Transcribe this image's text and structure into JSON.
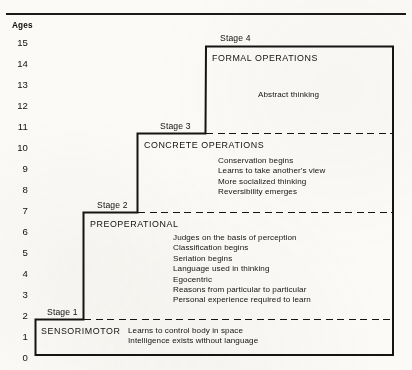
{
  "figure": {
    "running_head": "The Developing Person Through the Life Span",
    "axis_title": "Ages",
    "age_ticks": [
      "15",
      "14",
      "13",
      "12",
      "11",
      "10",
      "9",
      "8",
      "7",
      "6",
      "5",
      "4",
      "3",
      "2",
      "1",
      "0"
    ]
  },
  "stages": [
    {
      "tag": "Stage 1",
      "heading": "SENSORIMOTOR",
      "details": [
        "Learns to control body in space",
        "Intelligence exists without language"
      ],
      "age_start": 0,
      "age_end": 2
    },
    {
      "tag": "Stage 2",
      "heading": "PREOPERATIONAL",
      "details": [
        "Judges on the basis of perception",
        "Classification begins",
        "Seriation begins",
        "Language used in thinking",
        "Egocentric",
        "Reasons from particular to particular",
        "Personal experience required to learn"
      ],
      "age_start": 2,
      "age_end": 7
    },
    {
      "tag": "Stage 3",
      "heading": "CONCRETE OPERATIONS",
      "details": [
        "Conservation begins",
        "Learns to take another's view",
        "More socialized thinking",
        "Reversibility emerges"
      ],
      "age_start": 7,
      "age_end": 11
    },
    {
      "tag": "Stage 4",
      "heading": "FORMAL OPERATIONS",
      "details": [
        "Abstract thinking"
      ],
      "age_start": 11,
      "age_end": 15
    }
  ],
  "chart_data": {
    "type": "table",
    "xlabel": "",
    "ylabel": "Ages",
    "ylim": [
      0,
      15
    ],
    "grid": false,
    "legend": "none",
    "categories": [
      "Stage 1",
      "Stage 2",
      "Stage 3",
      "Stage 4"
    ],
    "series": [
      {
        "name": "Age range start",
        "values": [
          0,
          2,
          7,
          11
        ]
      },
      {
        "name": "Age range end",
        "values": [
          2,
          7,
          11,
          15
        ]
      }
    ],
    "annotations": [
      "Stage 1 SENSORIMOTOR spans ages 0-2",
      "Stage 2 PREOPERATIONAL spans ages 2-7",
      "Stage 3 CONCRETE OPERATIONS spans ages 7-11",
      "Stage 4 FORMAL OPERATIONS spans ages 11-15"
    ]
  },
  "colors": {
    "ink": "#141414",
    "paper": "#fbfaf7",
    "rule": "#1a1a1a"
  }
}
